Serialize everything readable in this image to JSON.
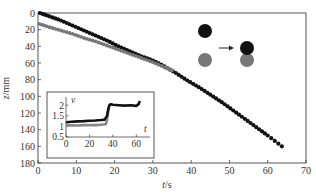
{
  "chart_data": {
    "type": "scatter",
    "title": "",
    "xlabel": "t/s",
    "xlabel_var": "t",
    "xlabel_unit": "/s",
    "ylabel": "z/mm",
    "ylabel_var": "z",
    "ylabel_unit": "/mm",
    "xlim": [
      0,
      70
    ],
    "ylim": [
      0,
      180
    ],
    "y_inverted": true,
    "xticks": [
      0,
      10,
      20,
      30,
      40,
      50,
      60,
      70
    ],
    "yticks": [
      0,
      20,
      40,
      60,
      80,
      100,
      120,
      140,
      160,
      180
    ],
    "grid": false,
    "series": [
      {
        "name": "black sphere",
        "color": "#111111",
        "x": [
          0.5,
          3,
          6,
          9,
          12,
          15,
          18,
          21,
          24,
          27,
          30,
          33,
          36,
          39,
          42,
          45,
          48,
          51,
          54,
          57,
          60,
          63.7
        ],
        "y": [
          0,
          4,
          9,
          15,
          21,
          27,
          33,
          40,
          46,
          52,
          57,
          64,
          72,
          81,
          89,
          98,
          107,
          117,
          127,
          137,
          147,
          160
        ]
      },
      {
        "name": "gray sphere",
        "color": "#777777",
        "x": [
          0.3,
          3,
          6,
          9,
          12,
          15,
          18,
          21,
          24,
          27,
          30,
          33,
          35
        ],
        "y": [
          13,
          17,
          21,
          25,
          30,
          34,
          39,
          44,
          49,
          54,
          59,
          65,
          69
        ]
      }
    ],
    "annotation": {
      "description": "schematic: two spheres (black above gray) separated, arrow, then spheres in contact",
      "before": [
        "black",
        "gray"
      ],
      "after": [
        "black",
        "gray"
      ],
      "arrow": "right-arrow",
      "colors": {
        "black": "#111111",
        "gray": "#777777"
      }
    },
    "inset": {
      "type": "line",
      "xlabel": "t",
      "ylabel": "v",
      "xlim": [
        0,
        70
      ],
      "ylim": [
        0.5,
        2.2
      ],
      "xticks": [
        0,
        20,
        40,
        60
      ],
      "yticks": [
        0.5,
        1,
        1.5,
        2
      ],
      "ytick_labels": [
        "0.5",
        "1",
        "1.5",
        "2"
      ],
      "series": [
        {
          "name": "black sphere",
          "color": "#111111",
          "x": [
            0,
            5,
            10,
            15,
            20,
            25,
            30,
            33,
            35,
            36,
            37,
            38,
            40,
            45,
            50,
            55,
            60,
            62,
            63
          ],
          "y": [
            1.2,
            1.22,
            1.24,
            1.25,
            1.27,
            1.28,
            1.3,
            1.32,
            1.5,
            1.8,
            2.0,
            2.05,
            2.02,
            2.0,
            1.98,
            2.0,
            1.97,
            2.05,
            2.2
          ]
        },
        {
          "name": "gray sphere",
          "color": "#888888",
          "x": [
            0,
            5,
            10,
            15,
            20,
            25,
            30,
            34,
            35,
            36,
            37
          ],
          "y": [
            1.05,
            1.05,
            1.04,
            1.06,
            1.07,
            1.06,
            1.08,
            1.1,
            1.3,
            1.7,
            2.0
          ]
        }
      ]
    }
  }
}
